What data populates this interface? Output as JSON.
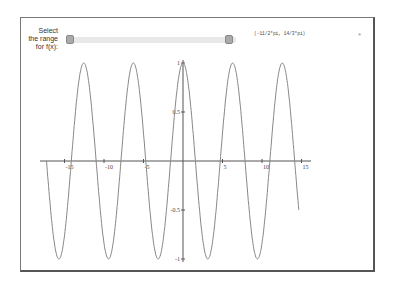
{
  "control": {
    "label": "Select the range for f(x):",
    "range_text": "(-11/2*pi, 14/3*pi)",
    "slider": {
      "min_handle_pct": 0.02,
      "max_handle_pct": 0.96
    },
    "close_icon": "*"
  },
  "plot": {
    "function": "cos(x)",
    "x_range": [
      -17.28,
      14.66
    ],
    "x_ticks": [
      "-15",
      "-10",
      "-5",
      "5",
      "10",
      "15"
    ],
    "y_ticks": [
      "1",
      "0.5",
      "-0.5",
      "-1"
    ],
    "line_color": "#888888",
    "axis_color": "#555555"
  }
}
